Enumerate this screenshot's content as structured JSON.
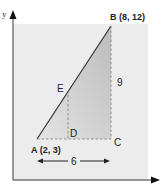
{
  "diagram": {
    "type": "coordinate-geometry",
    "axes": {
      "x_label": "x",
      "y_label": "y"
    },
    "points": {
      "A": {
        "label": "A (2, 3)",
        "x": 2,
        "y": 3
      },
      "B": {
        "label": "B (8, 12)",
        "x": 8,
        "y": 12
      },
      "C": {
        "label": "C"
      },
      "D": {
        "label": "D"
      },
      "E": {
        "label": "E"
      }
    },
    "measurements": {
      "horizontal": "6",
      "vertical": "9"
    },
    "colors": {
      "panel": "#ececec",
      "triangle_fill": "#d0d0d0",
      "line": "#333333",
      "dashed": "#888888"
    }
  }
}
